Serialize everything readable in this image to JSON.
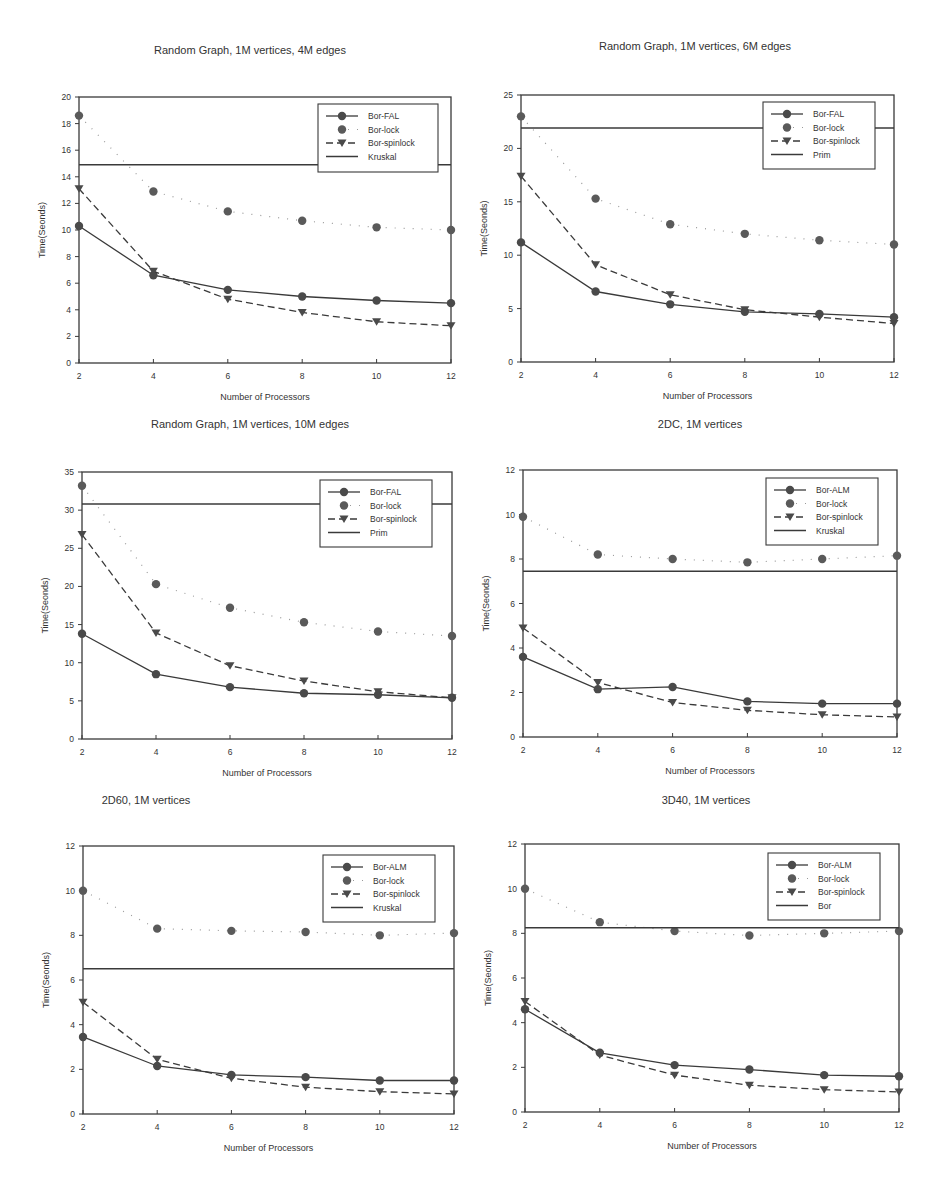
{
  "page": {
    "top_cut_text": ""
  },
  "chart_data": [
    {
      "type": "line",
      "title": "Random Graph, 1M vertices, 4M edges",
      "xlabel": "Number of Processors",
      "ylabel": "Time(Seonds)",
      "x": [
        2,
        4,
        6,
        8,
        10,
        12
      ],
      "xticks": [
        2,
        4,
        6,
        8,
        10,
        12
      ],
      "yticks": [
        0,
        2,
        4,
        6,
        8,
        10,
        12,
        14,
        16,
        18,
        20
      ],
      "ylim": [
        0,
        20
      ],
      "xlim": [
        2,
        12
      ],
      "grid": false,
      "legend_position": "upper right",
      "series": [
        {
          "name": "Bor-FAL",
          "style": "solid-circle",
          "values": [
            10.3,
            6.6,
            5.5,
            5.0,
            4.7,
            4.5
          ]
        },
        {
          "name": "Bor-lock",
          "style": "dotted-circle",
          "values": [
            18.6,
            12.9,
            11.4,
            10.7,
            10.2,
            10.0
          ]
        },
        {
          "name": "Bor-spinlock",
          "style": "dashed-triangle",
          "values": [
            13.1,
            6.9,
            4.8,
            3.8,
            3.1,
            2.8
          ]
        },
        {
          "name": "Kruskal",
          "style": "hline",
          "values": [
            14.9,
            14.9,
            14.9,
            14.9,
            14.9,
            14.9
          ]
        }
      ]
    },
    {
      "type": "line",
      "title": "Random Graph, 1M vertices, 6M edges",
      "xlabel": "Number of Processors",
      "ylabel": "Time(Seonds)",
      "x": [
        2,
        4,
        6,
        8,
        10,
        12
      ],
      "xticks": [
        2,
        4,
        6,
        8,
        10,
        12
      ],
      "yticks": [
        0,
        5,
        10,
        15,
        20,
        25
      ],
      "ylim": [
        0,
        25
      ],
      "xlim": [
        2,
        12
      ],
      "grid": false,
      "legend_position": "upper right",
      "series": [
        {
          "name": "Bor-FAL",
          "style": "solid-circle",
          "values": [
            11.2,
            6.6,
            5.4,
            4.7,
            4.5,
            4.2
          ]
        },
        {
          "name": "Bor-lock",
          "style": "dotted-circle",
          "values": [
            23.0,
            15.3,
            12.9,
            12.0,
            11.4,
            11.0
          ]
        },
        {
          "name": "Bor-spinlock",
          "style": "dashed-triangle",
          "values": [
            17.4,
            9.1,
            6.3,
            4.9,
            4.2,
            3.6
          ]
        },
        {
          "name": "Prim",
          "style": "hline",
          "values": [
            21.9,
            21.9,
            21.9,
            21.9,
            21.9,
            21.9
          ]
        }
      ]
    },
    {
      "type": "line",
      "title": "Random Graph, 1M vertices, 10M edges",
      "xlabel": "Number of Processors",
      "ylabel": "Time(Seonds)",
      "x": [
        2,
        4,
        6,
        8,
        10,
        12
      ],
      "xticks": [
        2,
        4,
        6,
        8,
        10,
        12
      ],
      "yticks": [
        0,
        5,
        10,
        15,
        20,
        25,
        30,
        35
      ],
      "ylim": [
        0,
        35
      ],
      "xlim": [
        2,
        12
      ],
      "grid": false,
      "legend_position": "upper right",
      "series": [
        {
          "name": "Bor-FAL",
          "style": "solid-circle",
          "values": [
            13.8,
            8.5,
            6.8,
            6.0,
            5.8,
            5.4
          ]
        },
        {
          "name": "Bor-lock",
          "style": "dotted-circle",
          "values": [
            33.2,
            20.3,
            17.2,
            15.3,
            14.1,
            13.5
          ]
        },
        {
          "name": "Bor-spinlock",
          "style": "dashed-triangle",
          "values": [
            26.8,
            13.9,
            9.6,
            7.6,
            6.2,
            5.4
          ]
        },
        {
          "name": "Prim",
          "style": "hline",
          "values": [
            30.8,
            30.8,
            30.8,
            30.8,
            30.8,
            30.8
          ]
        }
      ]
    },
    {
      "type": "line",
      "title": "2DC, 1M vertices",
      "xlabel": "Number of Processors",
      "ylabel": "Time(Seonds)",
      "x": [
        2,
        4,
        6,
        8,
        10,
        12
      ],
      "xticks": [
        2,
        4,
        6,
        8,
        10,
        12
      ],
      "yticks": [
        0,
        2,
        4,
        6,
        8,
        10,
        12
      ],
      "ylim": [
        0,
        12
      ],
      "xlim": [
        2,
        12
      ],
      "grid": false,
      "legend_position": "upper right",
      "series": [
        {
          "name": "Bor-ALM",
          "style": "solid-circle",
          "values": [
            3.6,
            2.15,
            2.25,
            1.6,
            1.5,
            1.5
          ]
        },
        {
          "name": "Bor-lock",
          "style": "dotted-circle",
          "values": [
            9.9,
            8.2,
            8.0,
            7.85,
            8.0,
            8.15
          ]
        },
        {
          "name": "Bor-spinlock",
          "style": "dashed-triangle",
          "values": [
            4.9,
            2.45,
            1.55,
            1.2,
            1.0,
            0.9
          ]
        },
        {
          "name": "Kruskal",
          "style": "hline",
          "values": [
            7.45,
            7.45,
            7.45,
            7.45,
            7.45,
            7.45
          ]
        }
      ]
    },
    {
      "type": "line",
      "title": "2D60, 1M vertices",
      "xlabel": "Number of Processors",
      "ylabel": "Time(Seonds)",
      "x": [
        2,
        4,
        6,
        8,
        10,
        12
      ],
      "xticks": [
        2,
        4,
        6,
        8,
        10,
        12
      ],
      "yticks": [
        0,
        2,
        4,
        6,
        8,
        10,
        12
      ],
      "ylim": [
        0,
        12
      ],
      "xlim": [
        2,
        12
      ],
      "grid": false,
      "legend_position": "upper right",
      "series": [
        {
          "name": "Bor-ALM",
          "style": "solid-circle",
          "values": [
            3.45,
            2.15,
            1.75,
            1.65,
            1.5,
            1.5
          ]
        },
        {
          "name": "Bor-lock",
          "style": "dotted-circle",
          "values": [
            10.0,
            8.3,
            8.2,
            8.15,
            8.0,
            8.1
          ]
        },
        {
          "name": "Bor-spinlock",
          "style": "dashed-triangle",
          "values": [
            5.0,
            2.45,
            1.6,
            1.2,
            1.0,
            0.9
          ]
        },
        {
          "name": "Kruskal",
          "style": "hline",
          "values": [
            6.5,
            6.5,
            6.5,
            6.5,
            6.5,
            6.5
          ]
        }
      ]
    },
    {
      "type": "line",
      "title": "3D40, 1M vertices",
      "xlabel": "Number of Processors",
      "ylabel": "Time(Seonds)",
      "x": [
        2,
        4,
        6,
        8,
        10,
        12
      ],
      "xticks": [
        2,
        4,
        6,
        8,
        10,
        12
      ],
      "yticks": [
        0,
        2,
        4,
        6,
        8,
        10,
        12
      ],
      "ylim": [
        0,
        12
      ],
      "xlim": [
        2,
        12
      ],
      "grid": false,
      "legend_position": "upper right",
      "series": [
        {
          "name": "Bor-ALM",
          "style": "solid-circle",
          "values": [
            4.6,
            2.65,
            2.1,
            1.9,
            1.65,
            1.6
          ]
        },
        {
          "name": "Bor-lock",
          "style": "dotted-circle",
          "values": [
            10.0,
            8.5,
            8.1,
            7.9,
            8.0,
            8.1
          ]
        },
        {
          "name": "Bor-spinlock",
          "style": "dashed-triangle",
          "values": [
            4.95,
            2.55,
            1.65,
            1.2,
            1.0,
            0.9
          ]
        },
        {
          "name": "Bor",
          "style": "hline",
          "values": [
            8.25,
            8.25,
            8.25,
            8.25,
            8.25,
            8.25
          ]
        }
      ]
    }
  ],
  "layout_colors": {
    "line": "#3a3a3a",
    "marker": "#4a4a4a",
    "lock_marker": "#5a5a5a",
    "text": "#333333"
  }
}
